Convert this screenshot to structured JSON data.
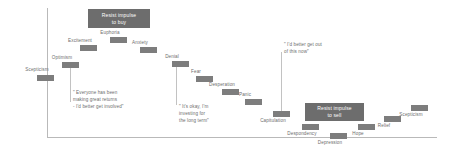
{
  "diagram": {
    "axis": {
      "vertical_line": true,
      "horizontal_line": true,
      "color": "#b9b9b9"
    },
    "colors": {
      "marker_bar": "#7d7d7d",
      "callout_background": "#6d6d6d",
      "callout_text": "#ffffff",
      "label_text": "#6e6e6e",
      "axis": "#b9b9b9",
      "page_background": "#ffffff"
    },
    "callouts": [
      {
        "id": "resist-buy",
        "line1": "Resist impulse",
        "line2": "to buy"
      },
      {
        "id": "resist-sell",
        "line1": "Resist impulse",
        "line2": "to sell"
      }
    ],
    "markers": [
      {
        "id": "scepticism-1",
        "label": "Scepticism",
        "position": "below"
      },
      {
        "id": "optimism",
        "label": "Optimism",
        "position": "above"
      },
      {
        "id": "excitement",
        "label": "Excitement",
        "position": "above"
      },
      {
        "id": "euphoria",
        "label": "Euphoria",
        "position": "above"
      },
      {
        "id": "anxiety",
        "label": "Anxiety",
        "position": "above"
      },
      {
        "id": "denial",
        "label": "Denial",
        "position": "above"
      },
      {
        "id": "fear",
        "label": "Fear",
        "position": "above"
      },
      {
        "id": "desperation",
        "label": "Desperation",
        "position": "above"
      },
      {
        "id": "panic",
        "label": "Panic",
        "position": "above"
      },
      {
        "id": "capitulation",
        "label": "Capitulation",
        "position": "below"
      },
      {
        "id": "despondency",
        "label": "Despondency",
        "position": "below"
      },
      {
        "id": "depression",
        "label": "Depression",
        "position": "below"
      },
      {
        "id": "hope",
        "label": "Hope",
        "position": "below"
      },
      {
        "id": "relief",
        "label": "Relief",
        "position": "below"
      },
      {
        "id": "scepticism-2",
        "label": "Scepticism",
        "position": "below"
      }
    ],
    "quotes": [
      {
        "id": "quote-optimism",
        "text": "\" Everyone has been\nmaking great returns\n- I'd better get involved\""
      },
      {
        "id": "quote-denial",
        "text": "\" It's okay, I'm\ninvesting for\nthe long term\""
      },
      {
        "id": "quote-panic",
        "text": "\" I'd better get out\nof this now\""
      }
    ]
  }
}
